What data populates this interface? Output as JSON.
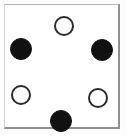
{
  "diagram": {
    "canvas": {
      "width": 131,
      "height": 139
    },
    "frame": {
      "x": 4,
      "y": 4,
      "width": 116,
      "height": 125,
      "background": "#ffffff",
      "border_light": "#cfcfcf",
      "border_dark": "#8f8f8f"
    },
    "colors": {
      "filled": "#111111",
      "open_fill": "#ffffff",
      "open_stroke": "#2b2b2b",
      "page_background": "#fdfdfd"
    },
    "counts": {
      "total": 6,
      "filled": 3,
      "open": 3
    },
    "nodes": [
      {
        "id": "node-top",
        "label": "top",
        "state": "open",
        "cx": 63,
        "cy": 25,
        "r": 10
      },
      {
        "id": "node-upper-left",
        "label": "upper-left",
        "state": "filled",
        "cx": 20,
        "cy": 48,
        "r": 11
      },
      {
        "id": "node-upper-right",
        "label": "upper-right",
        "state": "filled",
        "cx": 101,
        "cy": 49,
        "r": 11
      },
      {
        "id": "node-lower-left",
        "label": "lower-left",
        "state": "open",
        "cx": 20,
        "cy": 94,
        "r": 10
      },
      {
        "id": "node-lower-right",
        "label": "lower-right",
        "state": "open",
        "cx": 97,
        "cy": 97,
        "r": 10
      },
      {
        "id": "node-bottom",
        "label": "bottom",
        "state": "filled",
        "cx": 60,
        "cy": 120,
        "r": 11
      }
    ]
  }
}
